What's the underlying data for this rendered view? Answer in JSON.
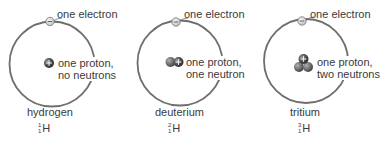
{
  "figure": {
    "colors": {
      "orbit": "#6e6e6e",
      "electron_fill": "#d9d9d9",
      "electron_stroke": "#777777",
      "proton_fill": "#4a4a4a",
      "neutron_fill": "#6b6b6b",
      "text": "#3a3a3a"
    },
    "atoms": [
      {
        "name": "hydrogen",
        "electron_label": "one electron",
        "nucleus_label_line1": "one proton,",
        "nucleus_label_line2": "no neutrons",
        "symbol": {
          "mass_number": "1",
          "atomic_number": "1",
          "element": "H"
        },
        "protons": 1,
        "neutrons": 0
      },
      {
        "name": "deuterium",
        "electron_label": "one electron",
        "nucleus_label_line1": "one proton,",
        "nucleus_label_line2": "one neutron",
        "symbol": {
          "mass_number": "2",
          "atomic_number": "1",
          "element": "H"
        },
        "protons": 1,
        "neutrons": 1
      },
      {
        "name": "tritium",
        "electron_label": "one electron",
        "nucleus_label_line1": "one proton,",
        "nucleus_label_line2": "two neutrons",
        "symbol": {
          "mass_number": "3",
          "atomic_number": "1",
          "element": "H"
        },
        "protons": 1,
        "neutrons": 2
      }
    ]
  }
}
